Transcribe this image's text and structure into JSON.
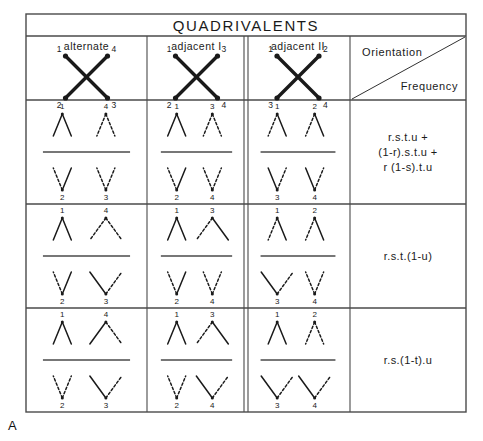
{
  "figure": {
    "title": "QUADRIVALENTS",
    "panel_label": "A",
    "corner_cell": {
      "top_label": "Orientation",
      "bottom_label": "Frequency",
      "divider": "diagonal"
    },
    "columns": [
      {
        "header": "alternate",
        "pole_top": [
          "1",
          "4"
        ],
        "pole_bottom": [
          "2",
          "3"
        ]
      },
      {
        "header": "adjacent I",
        "pole_top": [
          "1",
          "3"
        ],
        "pole_bottom": [
          "2",
          "4"
        ]
      },
      {
        "header": "adjacent II",
        "pole_top": [
          "1",
          "2"
        ],
        "pole_bottom": [
          "3",
          "4"
        ]
      }
    ],
    "rows": [
      {
        "frequency_lines": [
          "r.s.t.u  +",
          "(1-r).s.t.u  +",
          "r (1-s).t.u"
        ],
        "cells": [
          {
            "top": [
              {
                "label": "1",
                "left": "solid",
                "right": "solid",
                "spread": "narrow"
              },
              {
                "label": "4",
                "left": "dashed",
                "right": "dashed",
                "spread": "narrow"
              }
            ],
            "bottom": [
              {
                "label": "2",
                "left": "dashed",
                "right": "solid",
                "spread": "narrow"
              },
              {
                "label": "3",
                "left": "dashed",
                "right": "dashed",
                "spread": "narrow"
              }
            ]
          },
          {
            "top": [
              {
                "label": "1",
                "left": "solid",
                "right": "solid",
                "spread": "narrow"
              },
              {
                "label": "3",
                "left": "dashed",
                "right": "dashed",
                "spread": "narrow"
              }
            ],
            "bottom": [
              {
                "label": "2",
                "left": "dashed",
                "right": "solid",
                "spread": "narrow"
              },
              {
                "label": "4",
                "left": "dashed",
                "right": "dashed",
                "spread": "narrow"
              }
            ]
          },
          {
            "top": [
              {
                "label": "1",
                "left": "dashed",
                "right": "solid",
                "spread": "narrow"
              },
              {
                "label": "2",
                "left": "dashed",
                "right": "solid",
                "spread": "narrow"
              }
            ],
            "bottom": [
              {
                "label": "3",
                "left": "solid",
                "right": "dashed",
                "spread": "narrow"
              },
              {
                "label": "4",
                "left": "solid",
                "right": "dashed",
                "spread": "narrow"
              }
            ]
          }
        ]
      },
      {
        "frequency_lines": [
          "r.s.t.(1-u)"
        ],
        "cells": [
          {
            "top": [
              {
                "label": "1",
                "left": "solid",
                "right": "solid",
                "spread": "narrow"
              },
              {
                "label": "4",
                "left": "dashed",
                "right": "dashed",
                "spread": "wide"
              }
            ],
            "bottom": [
              {
                "label": "2",
                "left": "dashed",
                "right": "solid",
                "spread": "narrow"
              },
              {
                "label": "3",
                "left": "solid",
                "right": "dashed",
                "spread": "wide"
              }
            ]
          },
          {
            "top": [
              {
                "label": "1",
                "left": "solid",
                "right": "solid",
                "spread": "narrow"
              },
              {
                "label": "3",
                "left": "dashed",
                "right": "solid",
                "spread": "wide"
              }
            ],
            "bottom": [
              {
                "label": "2",
                "left": "dashed",
                "right": "solid",
                "spread": "narrow"
              },
              {
                "label": "4",
                "left": "dashed",
                "right": "dashed",
                "spread": "narrow"
              }
            ]
          },
          {
            "top": [
              {
                "label": "1",
                "left": "dashed",
                "right": "solid",
                "spread": "narrow"
              },
              {
                "label": "2",
                "left": "dashed",
                "right": "solid",
                "spread": "narrow"
              }
            ],
            "bottom": [
              {
                "label": "3",
                "left": "solid",
                "right": "dashed",
                "spread": "wide"
              },
              {
                "label": "4",
                "left": "dashed",
                "right": "dashed",
                "spread": "narrow"
              }
            ]
          }
        ]
      },
      {
        "frequency_lines": [
          "r.s.(1-t).u"
        ],
        "cells": [
          {
            "top": [
              {
                "label": "1",
                "left": "solid",
                "right": "solid",
                "spread": "narrow"
              },
              {
                "label": "4",
                "left": "solid",
                "right": "dashed",
                "spread": "wide"
              }
            ],
            "bottom": [
              {
                "label": "2",
                "left": "dashed",
                "right": "dashed",
                "spread": "narrow"
              },
              {
                "label": "3",
                "left": "solid",
                "right": "dashed",
                "spread": "wide"
              }
            ]
          },
          {
            "top": [
              {
                "label": "1",
                "left": "solid",
                "right": "solid",
                "spread": "narrow"
              },
              {
                "label": "3",
                "left": "dashed",
                "right": "solid",
                "spread": "wide"
              }
            ],
            "bottom": [
              {
                "label": "2",
                "left": "dashed",
                "right": "dashed",
                "spread": "narrow"
              },
              {
                "label": "4",
                "left": "solid",
                "right": "dashed",
                "spread": "wide"
              }
            ]
          },
          {
            "top": [
              {
                "label": "1",
                "left": "solid",
                "right": "solid",
                "spread": "narrow"
              },
              {
                "label": "2",
                "left": "dashed",
                "right": "dashed",
                "spread": "narrow"
              }
            ],
            "bottom": [
              {
                "label": "3",
                "left": "solid",
                "right": "dashed",
                "spread": "wide"
              },
              {
                "label": "4",
                "left": "solid",
                "right": "dashed",
                "spread": "wide"
              }
            ]
          }
        ]
      }
    ],
    "colors": {
      "ink": "#1a1a1a",
      "rule": "#4a4a4a",
      "background": "#ffffff"
    }
  }
}
